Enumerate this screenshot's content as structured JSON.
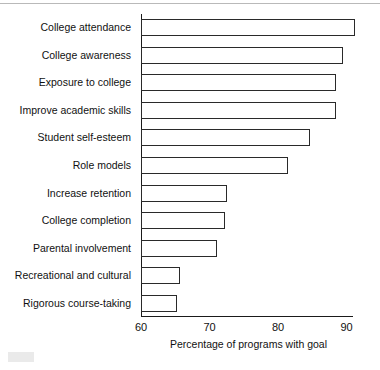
{
  "chart_data": {
    "type": "bar",
    "orientation": "horizontal",
    "title": "",
    "xlabel": "Percentage of programs with goal",
    "ylabel": "",
    "xlim": [
      60,
      93
    ],
    "xticks": [
      60,
      70,
      80,
      90
    ],
    "xtick_labels": [
      "60",
      "70",
      "80",
      "90"
    ],
    "grid": false,
    "legend": null,
    "bar_style": {
      "fill": "#ffffff",
      "edge": "#2a2a2a"
    },
    "categories": [
      "College attendance",
      "College awareness",
      "Exposure to college",
      "Improve academic skills",
      "Student self-esteem",
      "Role models",
      "Increase retention",
      "College completion",
      "Parental involvement",
      "Recreational and cultural",
      "Rigorous course-taking"
    ],
    "values": [
      91.3,
      89.5,
      88.4,
      88.5,
      84.6,
      81.4,
      72.6,
      72.3,
      71.1,
      65.7,
      65.3
    ]
  },
  "axis": {
    "x_title": "Percentage of programs with goal"
  }
}
